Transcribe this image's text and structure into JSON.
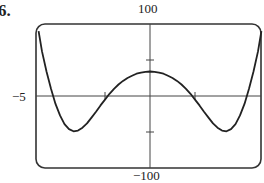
{
  "problem_label": "6.",
  "chart_data": {
    "type": "line",
    "title": "",
    "xlabel": "",
    "ylabel": "",
    "xlim": [
      -5,
      5
    ],
    "ylim": [
      -100,
      100
    ],
    "tick_labels": {
      "ymax": "100",
      "ymin": "−100",
      "xmin": "−5"
    },
    "x_ticks": [
      -2,
      2
    ],
    "y_ticks": [
      -50,
      50
    ],
    "grid": false,
    "series": [
      {
        "name": "f(x)",
        "x": [
          -4.95,
          -4.8,
          -4.6,
          -4.4,
          -4.2,
          -4.0,
          -3.8,
          -3.6,
          -3.4,
          -3.2,
          -3.0,
          -2.8,
          -2.6,
          -2.4,
          -2.2,
          -2.0,
          -1.8,
          -1.6,
          -1.4,
          -1.2,
          -1.0,
          -0.8,
          -0.6,
          -0.4,
          -0.2,
          0.0,
          0.2,
          0.4,
          0.6,
          0.8,
          1.0,
          1.2,
          1.4,
          1.6,
          1.8,
          2.0,
          2.2,
          2.4,
          2.6,
          2.8,
          3.0,
          3.2,
          3.4,
          3.6,
          3.8,
          4.0,
          4.2,
          4.4,
          4.6,
          4.8,
          4.95
        ],
        "values": [
          90,
          62,
          34,
          10,
          -11,
          -27,
          -39,
          -46,
          -49,
          -48,
          -44,
          -38,
          -30,
          -22,
          -13,
          -5,
          3,
          10,
          16,
          21,
          25,
          28,
          31,
          32.5,
          33.5,
          34,
          33.5,
          32.5,
          31,
          28,
          25,
          21,
          16,
          10,
          3,
          -5,
          -13,
          -22,
          -30,
          -38,
          -44,
          -48,
          -49,
          -46,
          -39,
          -27,
          -11,
          10,
          34,
          62,
          90
        ]
      }
    ]
  }
}
